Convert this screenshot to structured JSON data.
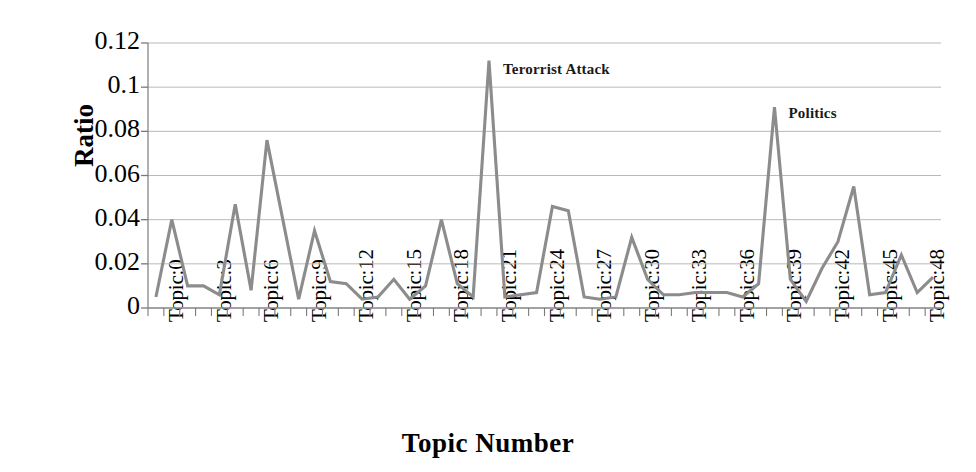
{
  "chart_data": {
    "type": "line",
    "title": "",
    "xlabel": "Topic Number",
    "ylabel": "Ratio",
    "ylim": [
      0,
      0.12
    ],
    "y_ticks": [
      "0",
      "0.02",
      "0.04",
      "0.06",
      "0.08",
      "0.1",
      "0.12"
    ],
    "y_tick_values": [
      0,
      0.02,
      0.04,
      0.06,
      0.08,
      0.1,
      0.12
    ],
    "x_tick_labels": [
      "Topic:0",
      "Topic:3",
      "Topic:6",
      "Topic:9",
      "Topic:12",
      "Topic:15",
      "Topic:18",
      "Topic:21",
      "Topic:24",
      "Topic:27",
      "Topic:30",
      "Topic:33",
      "Topic:36",
      "Topic:39",
      "Topic:42",
      "Topic:45",
      "Topic:48"
    ],
    "x_tick_indices": [
      0,
      3,
      6,
      9,
      12,
      15,
      18,
      21,
      24,
      27,
      30,
      33,
      36,
      39,
      42,
      45,
      48
    ],
    "grid": true,
    "legend": "none",
    "series_color": "#8c8c8c",
    "x": [
      0,
      1,
      2,
      3,
      4,
      5,
      6,
      7,
      8,
      9,
      10,
      11,
      12,
      13,
      14,
      15,
      16,
      17,
      18,
      19,
      20,
      21,
      22,
      23,
      24,
      25,
      26,
      27,
      28,
      29,
      30,
      31,
      32,
      33,
      34,
      35,
      36,
      37,
      38,
      39,
      40,
      41,
      42,
      43,
      44,
      45,
      46,
      47,
      48,
      49
    ],
    "values": [
      0.005,
      0.04,
      0.01,
      0.01,
      0.006,
      0.047,
      0.008,
      0.076,
      0.04,
      0.004,
      0.035,
      0.012,
      0.011,
      0.004,
      0.005,
      0.013,
      0.004,
      0.01,
      0.04,
      0.011,
      0.005,
      0.112,
      0.005,
      0.006,
      0.007,
      0.046,
      0.044,
      0.005,
      0.004,
      0.005,
      0.032,
      0.013,
      0.006,
      0.006,
      0.007,
      0.007,
      0.007,
      0.005,
      0.011,
      0.091,
      0.013,
      0.003,
      0.018,
      0.03,
      0.055,
      0.006,
      0.007,
      0.024,
      0.007,
      0.014
    ],
    "annotations": [
      {
        "text": "Terorrist Attack",
        "x_index": 21,
        "y_value": 0.108
      },
      {
        "text": "Politics",
        "x_index": 39,
        "y_value": 0.088
      }
    ]
  },
  "plot_geometry": {
    "left": 148,
    "right": 941,
    "top": 43,
    "bottom": 308
  },
  "axes": {
    "y_title": "Ratio",
    "x_title": "Topic Number"
  }
}
